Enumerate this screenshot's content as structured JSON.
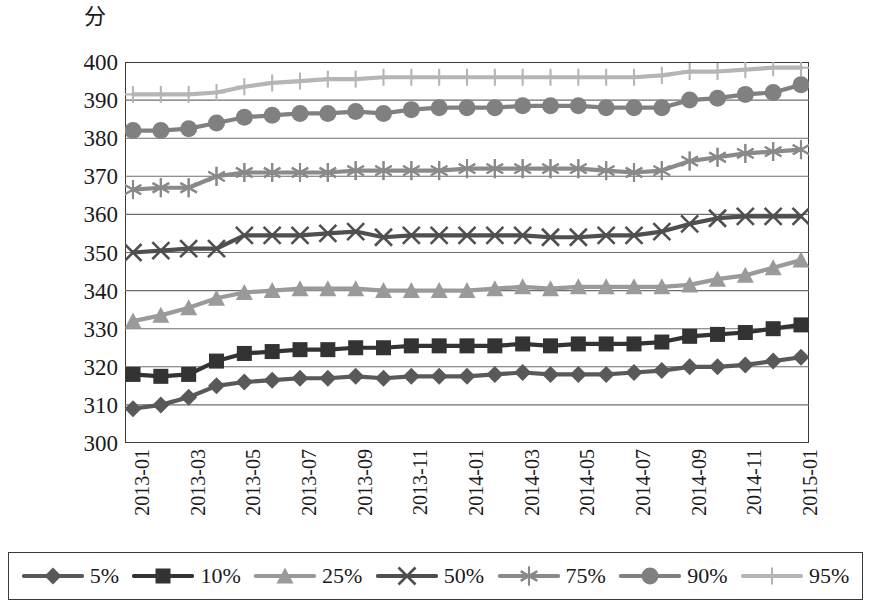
{
  "axis": {
    "y_unit_label": "分",
    "y_ticks": [
      400,
      390,
      380,
      370,
      360,
      350,
      340,
      330,
      320,
      310,
      300
    ],
    "x_ticks": [
      "2013-01",
      "2013-03",
      "2013-05",
      "2013-07",
      "2013-09",
      "2013-11",
      "2014-01",
      "2014-03",
      "2014-05",
      "2014-07",
      "2014-09",
      "2014-11",
      "2015-01"
    ]
  },
  "legend": {
    "items": [
      {
        "label": "5%",
        "marker": "diamond-marker",
        "color": "#595959"
      },
      {
        "label": "10%",
        "marker": "square-marker",
        "color": "#333333"
      },
      {
        "label": "25%",
        "marker": "triangle-marker",
        "color": "#9a9a9a"
      },
      {
        "label": "50%",
        "marker": "x-marker",
        "color": "#4f4f4f"
      },
      {
        "label": "75%",
        "marker": "asterisk-marker",
        "color": "#8a8a8a"
      },
      {
        "label": "90%",
        "marker": "circle-marker",
        "color": "#808080"
      },
      {
        "label": "95%",
        "marker": "plus-marker",
        "color": "#b5b5b5"
      }
    ]
  },
  "chart_data": {
    "type": "line",
    "title": "",
    "xlabel": "",
    "ylabel": "分",
    "ylim": [
      300,
      400
    ],
    "ytick_step": 10,
    "grid": true,
    "grid_axis": "y",
    "legend_position": "bottom",
    "x": [
      "2013-01",
      "2013-02",
      "2013-03",
      "2013-04",
      "2013-05",
      "2013-06",
      "2013-07",
      "2013-08",
      "2013-09",
      "2013-10",
      "2013-11",
      "2013-12",
      "2014-01",
      "2014-02",
      "2014-03",
      "2014-04",
      "2014-05",
      "2014-06",
      "2014-07",
      "2014-08",
      "2014-09",
      "2014-10",
      "2014-11",
      "2014-12",
      "2015-01"
    ],
    "x_tick_labels": [
      "2013-01",
      "2013-03",
      "2013-05",
      "2013-07",
      "2013-09",
      "2013-11",
      "2014-01",
      "2014-03",
      "2014-05",
      "2014-07",
      "2014-09",
      "2014-11",
      "2015-01"
    ],
    "series": [
      {
        "name": "5%",
        "marker": "diamond",
        "color": "#595959",
        "values": [
          309.0,
          310.0,
          312.0,
          315.0,
          316.0,
          316.5,
          317.0,
          317.0,
          317.5,
          317.0,
          317.5,
          317.5,
          317.5,
          318.0,
          318.5,
          318.0,
          318.0,
          318.0,
          318.5,
          319.0,
          320.0,
          320.0,
          320.5,
          321.5,
          322.5
        ]
      },
      {
        "name": "10%",
        "marker": "square",
        "color": "#333333",
        "values": [
          318.0,
          317.5,
          318.0,
          321.5,
          323.5,
          324.0,
          324.5,
          324.5,
          325.0,
          325.0,
          325.5,
          325.5,
          325.5,
          325.5,
          326.0,
          325.5,
          326.0,
          326.0,
          326.0,
          326.5,
          328.0,
          328.5,
          329.0,
          330.0,
          331.0
        ]
      },
      {
        "name": "25%",
        "marker": "triangle",
        "color": "#9a9a9a",
        "values": [
          332.0,
          333.5,
          335.5,
          338.0,
          339.5,
          340.0,
          340.5,
          340.5,
          340.5,
          340.0,
          340.0,
          340.0,
          340.0,
          340.5,
          341.0,
          340.5,
          341.0,
          341.0,
          341.0,
          341.0,
          341.5,
          343.0,
          344.0,
          346.0,
          348.0
        ]
      },
      {
        "name": "50%",
        "marker": "x",
        "color": "#4f4f4f",
        "values": [
          350.0,
          350.5,
          351.0,
          351.0,
          354.5,
          354.5,
          354.5,
          355.0,
          355.5,
          354.0,
          354.5,
          354.5,
          354.5,
          354.5,
          354.5,
          354.0,
          354.0,
          354.5,
          354.5,
          355.5,
          357.5,
          359.0,
          359.5,
          359.5,
          359.5
        ]
      },
      {
        "name": "75%",
        "marker": "asterisk",
        "color": "#8a8a8a",
        "values": [
          366.5,
          367.0,
          367.0,
          370.0,
          371.0,
          371.0,
          371.0,
          371.0,
          371.5,
          371.5,
          371.5,
          371.5,
          372.0,
          372.0,
          372.0,
          372.0,
          372.0,
          371.5,
          371.0,
          371.5,
          374.0,
          375.0,
          376.0,
          376.5,
          377.0
        ]
      },
      {
        "name": "90%",
        "marker": "circle",
        "color": "#808080",
        "values": [
          382.0,
          382.0,
          382.5,
          384.0,
          385.5,
          386.0,
          386.5,
          386.5,
          387.0,
          386.5,
          387.5,
          388.0,
          388.0,
          388.0,
          388.5,
          388.5,
          388.5,
          388.0,
          388.0,
          388.0,
          390.0,
          390.5,
          391.5,
          392.0,
          394.0
        ]
      },
      {
        "name": "95%",
        "marker": "plus",
        "color": "#b5b5b5",
        "values": [
          391.5,
          391.5,
          391.5,
          392.0,
          393.5,
          394.5,
          395.0,
          395.5,
          395.5,
          396.0,
          396.0,
          396.0,
          396.0,
          396.0,
          396.0,
          396.0,
          396.0,
          396.0,
          396.0,
          396.5,
          397.5,
          397.5,
          398.0,
          398.5,
          398.5
        ]
      }
    ]
  }
}
